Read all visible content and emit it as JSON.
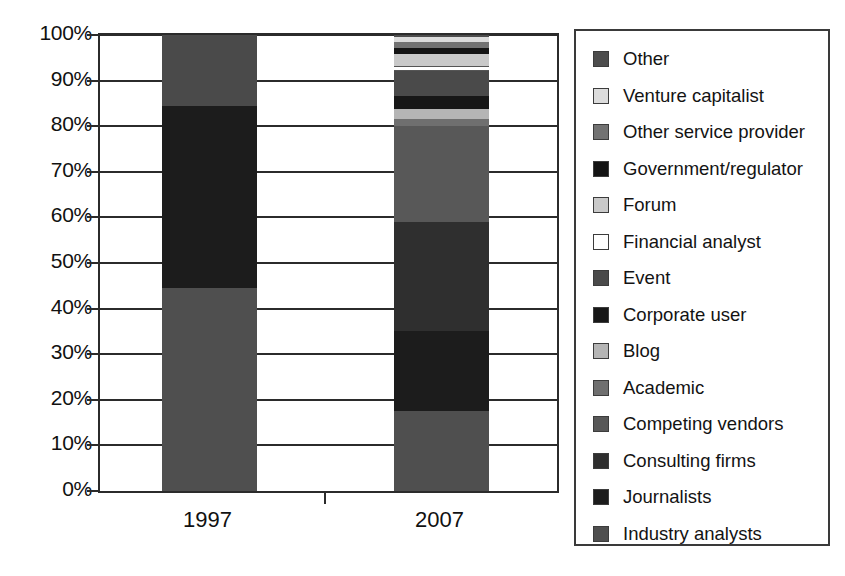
{
  "chart_data": {
    "type": "bar",
    "subtype": "stacked-percentage",
    "title": "",
    "xlabel": "",
    "ylabel": "",
    "categories": [
      "1997",
      "2007"
    ],
    "ylim": [
      0,
      100
    ],
    "ytick_labels": [
      "0%",
      "10%",
      "20%",
      "30%",
      "40%",
      "50%",
      "60%",
      "70%",
      "80%",
      "90%",
      "100%"
    ],
    "ytick_values": [
      0,
      10,
      20,
      30,
      40,
      50,
      60,
      70,
      80,
      90,
      100
    ],
    "grid": true,
    "legend_position": "right",
    "units": "percent",
    "series": [
      {
        "name": "Industry analysts",
        "color": "#4f4f4f",
        "values": [
          44.5,
          17.5
        ]
      },
      {
        "name": "Journalists",
        "color": "#1c1c1c",
        "values": [
          40.0,
          17.5
        ]
      },
      {
        "name": "Consulting firms",
        "color": "#2f2f2f",
        "values": [
          0.0,
          24.0
        ]
      },
      {
        "name": "Competing vendors",
        "color": "#585858",
        "values": [
          0.0,
          21.0
        ]
      },
      {
        "name": "Academic",
        "color": "#6f6f6f",
        "values": [
          0.0,
          1.5
        ]
      },
      {
        "name": "Blog",
        "color": "#b5b5b5",
        "values": [
          0.0,
          2.2
        ]
      },
      {
        "name": "Corporate user",
        "color": "#171717",
        "values": [
          0.0,
          3.0
        ]
      },
      {
        "name": "Event",
        "color": "#4a4a4a",
        "values": [
          15.5,
          5.5
        ]
      },
      {
        "name": "Financial analyst",
        "color": "#ffffff",
        "values": [
          0.0,
          1.1
        ]
      },
      {
        "name": "Forum",
        "color": "#c9c9c9",
        "values": [
          0.0,
          2.6
        ]
      },
      {
        "name": "Government/regulator",
        "color": "#141414",
        "values": [
          0.0,
          1.3
        ]
      },
      {
        "name": "Other service provider",
        "color": "#727272",
        "values": [
          0.0,
          1.3
        ]
      },
      {
        "name": "Venture capitalist",
        "color": "#dcdcdc",
        "values": [
          0.0,
          1.1
        ]
      },
      {
        "name": "Other",
        "color": "#4d4d4d",
        "values": [
          0.0,
          1.4
        ]
      }
    ],
    "stack_1997": [
      {
        "label": "Industry analysts",
        "from": 0.0,
        "to": 44.5,
        "color": "#4f4f4f"
      },
      {
        "label": "Journalists",
        "from": 44.5,
        "to": 84.5,
        "color": "#1c1c1c"
      },
      {
        "label": "Event",
        "from": 84.5,
        "to": 100.0,
        "color": "#4a4a4a"
      }
    ],
    "stack_2007": [
      {
        "label": "Industry analysts",
        "from": 0.0,
        "to": 17.5,
        "color": "#4f4f4f"
      },
      {
        "label": "Journalists",
        "from": 17.5,
        "to": 35.0,
        "color": "#1c1c1c"
      },
      {
        "label": "Consulting firms",
        "from": 35.0,
        "to": 59.0,
        "color": "#2f2f2f"
      },
      {
        "label": "Competing vendors",
        "from": 59.0,
        "to": 80.0,
        "color": "#585858"
      },
      {
        "label": "Academic",
        "from": 80.0,
        "to": 81.5,
        "color": "#6f6f6f"
      },
      {
        "label": "Blog",
        "from": 81.5,
        "to": 83.7,
        "color": "#b5b5b5"
      },
      {
        "label": "Corporate user",
        "from": 83.7,
        "to": 86.7,
        "color": "#171717"
      },
      {
        "label": "Event",
        "from": 86.7,
        "to": 92.2,
        "color": "#4a4a4a"
      },
      {
        "label": "Financial analyst",
        "from": 92.2,
        "to": 93.3,
        "color": "#ffffff"
      },
      {
        "label": "Forum",
        "from": 93.3,
        "to": 95.9,
        "color": "#c9c9c9"
      },
      {
        "label": "Government/regulator",
        "from": 95.9,
        "to": 97.2,
        "color": "#141414"
      },
      {
        "label": "Other service provider",
        "from": 97.2,
        "to": 98.5,
        "color": "#727272"
      },
      {
        "label": "Venture capitalist",
        "from": 98.5,
        "to": 99.6,
        "color": "#dcdcdc"
      },
      {
        "label": "Other",
        "from": 99.6,
        "to": 100.0,
        "color": "#4d4d4d"
      }
    ],
    "legend_entries": [
      {
        "label": "Other",
        "color": "#4d4d4d"
      },
      {
        "label": "Venture capitalist",
        "color": "#dcdcdc"
      },
      {
        "label": "Other service provider",
        "color": "#727272"
      },
      {
        "label": "Government/regulator",
        "color": "#141414"
      },
      {
        "label": "Forum",
        "color": "#c9c9c9"
      },
      {
        "label": "Financial analyst",
        "color": "#ffffff"
      },
      {
        "label": "Event",
        "color": "#4a4a4a"
      },
      {
        "label": "Corporate user",
        "color": "#171717"
      },
      {
        "label": "Blog",
        "color": "#b5b5b5"
      },
      {
        "label": "Academic",
        "color": "#6f6f6f"
      },
      {
        "label": "Competing vendors",
        "color": "#585858"
      },
      {
        "label": "Consulting firms",
        "color": "#2f2f2f"
      },
      {
        "label": "Journalists",
        "color": "#1c1c1c"
      },
      {
        "label": "Industry analysts",
        "color": "#4f4f4f"
      }
    ]
  },
  "axis": {
    "frame_color": "#2b2b2b"
  }
}
